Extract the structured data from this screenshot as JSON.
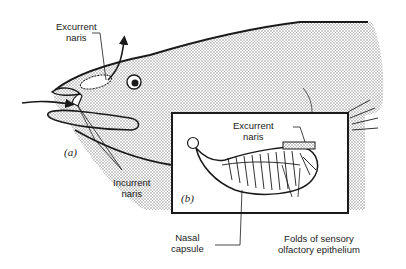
{
  "figure": {
    "panel_a_label": "(a)",
    "panel_b_label": "(b)",
    "labels": {
      "excurrent_naris_a": [
        "Excurrent",
        "naris"
      ],
      "incurrent_naris": [
        "Incurrent",
        "naris"
      ],
      "excurrent_naris_b": [
        "Excurrent",
        "naris"
      ],
      "nasal_capsule": [
        "Nasal",
        "capsule"
      ],
      "folds": [
        "Folds of sensory",
        "olfactory epithelium"
      ]
    },
    "colors": {
      "ink": "#1a1a1a",
      "stipple": "#9a9a9a",
      "background": "#ffffff"
    }
  }
}
